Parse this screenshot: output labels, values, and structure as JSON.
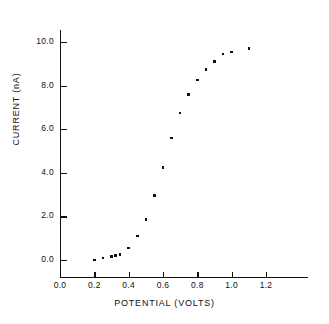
{
  "chart_data": {
    "type": "scatter",
    "title": "",
    "xlabel": "POTENTIAL (VOLTS)",
    "ylabel": "CURRENT (nA)",
    "xlim": [
      0.0,
      1.4
    ],
    "ylim": [
      0.0,
      10.8
    ],
    "xticks": [
      0.0,
      0.2,
      0.4,
      0.6,
      0.8,
      1.0,
      1.2
    ],
    "xtick_labels": [
      "0.0",
      "0.2",
      "0.4",
      "0.6",
      "0.8",
      "1.0",
      "1.2"
    ],
    "yticks": [
      0.0,
      2.0,
      4.0,
      6.0,
      8.0,
      10.0
    ],
    "ytick_labels": [
      "0.0",
      "2.0",
      "4.0",
      "6.0",
      "8.0",
      "10.0"
    ],
    "grid": false,
    "legend": null,
    "marker": "square",
    "marker_color": "#101010",
    "x": [
      0.2,
      0.25,
      0.3,
      0.325,
      0.35,
      0.4,
      0.45,
      0.5,
      0.55,
      0.6,
      0.65,
      0.7,
      0.75,
      0.8,
      0.85,
      0.9,
      0.95,
      1.0,
      1.1
    ],
    "y": [
      0.0,
      0.1,
      0.15,
      0.2,
      0.25,
      0.55,
      1.1,
      1.85,
      2.95,
      4.25,
      5.6,
      6.75,
      7.6,
      8.25,
      8.75,
      9.1,
      9.45,
      9.55,
      9.7
    ],
    "points": [
      {
        "x": 0.2,
        "y": 0.0
      },
      {
        "x": 0.25,
        "y": 0.1
      },
      {
        "x": 0.3,
        "y": 0.15
      },
      {
        "x": 0.325,
        "y": 0.2
      },
      {
        "x": 0.35,
        "y": 0.25
      },
      {
        "x": 0.4,
        "y": 0.55
      },
      {
        "x": 0.45,
        "y": 1.1
      },
      {
        "x": 0.5,
        "y": 1.85
      },
      {
        "x": 0.55,
        "y": 2.95
      },
      {
        "x": 0.6,
        "y": 4.25
      },
      {
        "x": 0.65,
        "y": 5.6
      },
      {
        "x": 0.7,
        "y": 6.75
      },
      {
        "x": 0.75,
        "y": 7.6
      },
      {
        "x": 0.8,
        "y": 8.25
      },
      {
        "x": 0.85,
        "y": 8.75
      },
      {
        "x": 0.9,
        "y": 9.1
      },
      {
        "x": 0.95,
        "y": 9.45
      },
      {
        "x": 1.0,
        "y": 9.55
      },
      {
        "x": 1.1,
        "y": 9.7
      }
    ]
  }
}
